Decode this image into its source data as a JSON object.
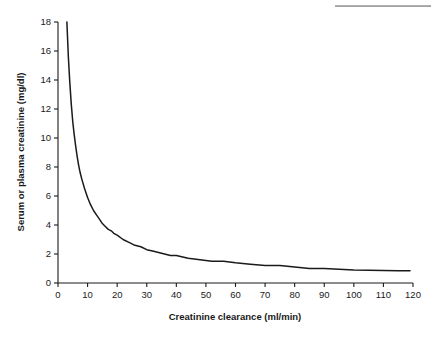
{
  "figure": {
    "top_rule_name": "header-rule"
  },
  "chart_data": {
    "type": "line",
    "title": "",
    "subtitle": "",
    "xlabel": "Creatinine clearance (ml/min)",
    "ylabel": "Serum or plasma creatinine (mg/dl)",
    "xlim": [
      0,
      120
    ],
    "ylim": [
      0,
      18
    ],
    "grid": false,
    "legend": null,
    "legend_position": "none",
    "xticks": [
      0,
      10,
      20,
      30,
      40,
      50,
      60,
      70,
      80,
      90,
      100,
      110,
      120
    ],
    "xtick_labels": [
      "0",
      "10",
      "20",
      "30",
      "40",
      "50",
      "60",
      "70",
      "80",
      "90",
      "100",
      "110",
      "120"
    ],
    "yticks": [
      0,
      2,
      4,
      6,
      8,
      10,
      12,
      14,
      16,
      18
    ],
    "ytick_labels": [
      "0",
      "2",
      "4",
      "6",
      "8",
      "10",
      "12",
      "14",
      "16",
      "18"
    ],
    "line_color": "#1a1a1a",
    "series": [
      {
        "name": "Serum or plasma creatinine vs creatinine clearance",
        "x": [
          3,
          3.5,
          4,
          4.5,
          5,
          5.5,
          6,
          6.5,
          7,
          7.5,
          8,
          9,
          10,
          11,
          12,
          13,
          14,
          15,
          16,
          17,
          18,
          19,
          20,
          22,
          24,
          26,
          28,
          30,
          32,
          34,
          36,
          38,
          40,
          44,
          48,
          52,
          56,
          60,
          65,
          70,
          75,
          80,
          85,
          90,
          95,
          100,
          105,
          110,
          115,
          119
        ],
        "y": [
          18.0,
          15.6,
          13.8,
          12.3,
          11.1,
          10.2,
          9.4,
          8.7,
          8.1,
          7.6,
          7.2,
          6.5,
          5.9,
          5.4,
          5.0,
          4.7,
          4.4,
          4.1,
          3.9,
          3.7,
          3.6,
          3.4,
          3.3,
          3.0,
          2.8,
          2.6,
          2.5,
          2.3,
          2.2,
          2.1,
          2.0,
          1.9,
          1.9,
          1.7,
          1.6,
          1.5,
          1.5,
          1.4,
          1.3,
          1.2,
          1.2,
          1.1,
          1.0,
          1.0,
          0.95,
          0.9,
          0.88,
          0.86,
          0.85,
          0.85
        ]
      }
    ],
    "annotations": []
  }
}
